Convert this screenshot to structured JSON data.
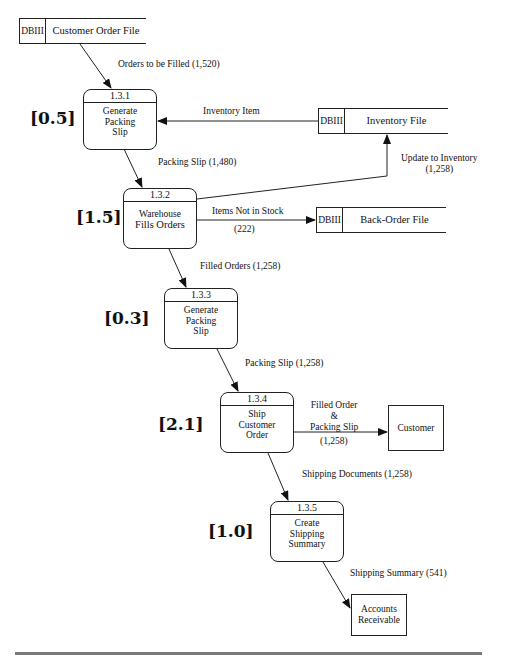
{
  "diagram": {
    "type": "data-flow-diagram",
    "data_stores": [
      {
        "tag": "DBIII",
        "name": "Customer Order File"
      },
      {
        "tag": "DBIII",
        "name": "Inventory File"
      },
      {
        "tag": "DBIII",
        "name": "Back-Order File"
      }
    ],
    "processes": [
      {
        "id": "1.3.1",
        "label": [
          "Generate",
          "Packing",
          "Slip"
        ],
        "estimate": "[0.5]"
      },
      {
        "id": "1.3.2",
        "label": [
          "Warehouse",
          "Fills Orders"
        ],
        "estimate": "[1.5]"
      },
      {
        "id": "1.3.3",
        "label": [
          "Generate",
          "Packing",
          "Slip"
        ],
        "estimate": "[0.3]"
      },
      {
        "id": "1.3.4",
        "label": [
          "Ship",
          "Customer",
          "Order"
        ],
        "estimate": "[2.1]"
      },
      {
        "id": "1.3.5",
        "label": [
          "Create",
          "Shipping",
          "Summary"
        ],
        "estimate": "[1.0]"
      }
    ],
    "external_entities": [
      {
        "label": [
          "Customer"
        ]
      },
      {
        "label": [
          "Accounts",
          "Receivable"
        ]
      }
    ],
    "flows": [
      {
        "from": "Customer Order File",
        "to": "1.3.1",
        "label": "Orders to be Filled (1,520)"
      },
      {
        "from": "Inventory File",
        "to": "1.3.1",
        "label": "Inventory Item"
      },
      {
        "from": "1.3.1",
        "to": "1.3.2",
        "label": "Packing Slip (1,480)"
      },
      {
        "from": "1.3.2",
        "to": "Inventory File",
        "label": "Update to Inventory",
        "label2": "(1,258)"
      },
      {
        "from": "1.3.2",
        "to": "Back-Order File",
        "label": "Items Not in Stock",
        "label2": "(222)"
      },
      {
        "from": "1.3.2",
        "to": "1.3.3",
        "label": "Filled Orders (1,258)"
      },
      {
        "from": "1.3.3",
        "to": "1.3.4",
        "label": "Packing Slip (1,258)"
      },
      {
        "from": "1.3.4",
        "to": "Customer",
        "label_lines": [
          "Filled Order",
          "&",
          "Packing Slip"
        ],
        "label2": "(1,258)"
      },
      {
        "from": "1.3.4",
        "to": "1.3.5",
        "label": "Shipping Documents (1,258)"
      },
      {
        "from": "1.3.5",
        "to": "Accounts Receivable",
        "label": "Shipping Summary (541)"
      }
    ]
  }
}
